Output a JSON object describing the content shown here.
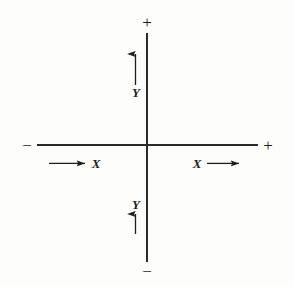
{
  "figure": {
    "background_color": "#fdfdfc",
    "ink_color": "#1e1e1e",
    "width": 294,
    "height": 287
  },
  "labels": {
    "y_positive": "Y",
    "y_negative": "Y",
    "x_negative": "X",
    "x_positive": "X",
    "sign_top": "+",
    "sign_bottom": "−",
    "sign_left": "−",
    "sign_right": "+"
  },
  "chart_data": {
    "type": "diagram",
    "title": "",
    "xlabel": "X",
    "ylabel": "Y",
    "grid": false,
    "legend": null,
    "origin": {
      "x": 147,
      "y": 145
    },
    "axes": [
      {
        "name": "horizontal-axis",
        "orientation": "horizontal",
        "from": {
          "x": 37,
          "y": 145
        },
        "to": {
          "x": 258,
          "y": 145
        },
        "negative_end_sign": "−",
        "positive_end_sign": "+"
      },
      {
        "name": "vertical-axis",
        "orientation": "vertical",
        "from": {
          "x": 147,
          "y": 33
        },
        "to": {
          "x": 147,
          "y": 262
        },
        "negative_end_sign": "−",
        "positive_end_sign": "+"
      }
    ],
    "direction_arrows": [
      {
        "name": "y-up-arrow",
        "label": "Y",
        "direction": "up",
        "tail": {
          "x": 135,
          "y": 85
        },
        "head": {
          "x": 135,
          "y": 47
        },
        "label_position": {
          "x": 136,
          "y": 92
        }
      },
      {
        "name": "y-down-arrow",
        "label": "Y",
        "direction": "down",
        "tail": {
          "x": 135,
          "y": 214
        },
        "head": {
          "x": 135,
          "y": 241
        },
        "label_position": {
          "x": 136,
          "y": 204
        }
      },
      {
        "name": "x-left-arrow",
        "label": "X",
        "direction": "left",
        "tail": {
          "x": 85,
          "y": 163
        },
        "head": {
          "x": 41,
          "y": 163
        },
        "label_position": {
          "x": 96,
          "y": 163
        }
      },
      {
        "name": "x-right-arrow",
        "label": "X",
        "direction": "right",
        "tail": {
          "x": 207,
          "y": 163
        },
        "head": {
          "x": 247,
          "y": 163
        },
        "label_position": {
          "x": 197,
          "y": 163
        }
      }
    ]
  }
}
